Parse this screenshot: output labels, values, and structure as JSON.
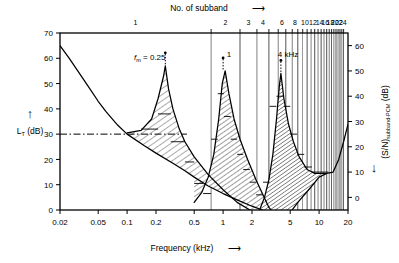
{
  "figure": {
    "top_axis_title": "No. of subband",
    "top_axis_arrow": "⟶",
    "x_axis_title": "Frequency (kHz)",
    "x_axis_arrow": "⟶",
    "y_left_title_main": "L",
    "y_left_title_sub": "T",
    "y_left_title_unit": " (dB)",
    "y_left_arrow": "↑",
    "y_right_title_main": "(S/N)",
    "y_right_title_sub": "subband-PCM",
    "y_right_title_unit": " (dB)",
    "y_right_arrow": "↓",
    "annotations": [
      {
        "id": "masker-1",
        "text_italic": "f",
        "text_sub": "m",
        "text_rest": " = 0.25",
        "freq_khz": 0.25,
        "level_db": 57
      },
      {
        "id": "masker-2",
        "text_plain": "1",
        "freq_khz": 1.0,
        "level_db": 55
      },
      {
        "id": "masker-3",
        "text_plain": "4 kHz",
        "freq_khz": 4.0,
        "level_db": 54
      }
    ]
  },
  "chart_data": {
    "type": "line",
    "title": "",
    "xlabel": "Frequency (kHz)",
    "ylabel": "L_T (dB)",
    "y2label": "(S/N)_subband-PCM (dB)",
    "xscale": "log",
    "xlim": [
      0.02,
      20
    ],
    "ylim": [
      0,
      70
    ],
    "y2lim": [
      65,
      -5
    ],
    "grid": false,
    "legend": null,
    "xticks": [
      0.02,
      0.05,
      0.1,
      0.2,
      0.5,
      1,
      2,
      5,
      10,
      20
    ],
    "xticklabels": [
      "0.02",
      "0.05",
      "0.1",
      "0.2",
      "0.5",
      "1",
      "2",
      "5",
      "10",
      "20"
    ],
    "yticks": [
      0,
      10,
      20,
      30,
      40,
      50,
      60,
      70
    ],
    "yticklabels": [
      "0",
      "10",
      "20",
      "30",
      "40",
      "50",
      "60",
      "70"
    ],
    "y2ticks": [
      0,
      10,
      20,
      30,
      40,
      50,
      60
    ],
    "y2ticklabels": [
      "0",
      "10",
      "20",
      "30",
      "40",
      "50",
      "60"
    ],
    "top_axis": {
      "label": "No. of subband",
      "labelled_subbands": [
        1,
        2,
        3,
        4,
        6,
        8,
        10,
        12,
        14,
        16,
        18,
        20,
        22,
        24
      ],
      "labelled_text": [
        "1",
        "2",
        "3",
        "4",
        "6",
        "8",
        "10",
        "12",
        "14",
        "16",
        "18",
        "20",
        "22",
        "24"
      ],
      "n_subbands": 24,
      "subband_edges_khz": [
        0.0,
        0.75,
        1.5,
        2.25,
        3.0,
        3.75,
        4.5,
        5.25,
        6.0,
        6.75,
        7.5,
        8.25,
        9.0,
        9.75,
        10.5,
        11.25,
        12.0,
        12.75,
        13.5,
        14.25,
        15.0,
        15.75,
        16.5,
        17.25,
        18.0
      ]
    },
    "series": [
      {
        "name": "threshold-in-quiet",
        "style": "solid",
        "points_khz_db": [
          [
            0.02,
            65
          ],
          [
            0.025,
            60
          ],
          [
            0.03,
            55.5
          ],
          [
            0.04,
            48.5
          ],
          [
            0.05,
            43
          ],
          [
            0.06,
            39
          ],
          [
            0.08,
            33.5
          ],
          [
            0.1,
            30
          ],
          [
            0.15,
            25.5
          ],
          [
            0.2,
            22.5
          ],
          [
            0.3,
            18.5
          ],
          [
            0.4,
            15.5
          ],
          [
            0.5,
            13
          ],
          [
            0.7,
            9.5
          ],
          [
            1.0,
            6.5
          ],
          [
            1.5,
            3.5
          ],
          [
            2.0,
            1.5
          ],
          [
            3.0,
            -1.0
          ],
          [
            3.5,
            -2.0
          ],
          [
            4.0,
            -3.0
          ],
          [
            5.0,
            -1.0
          ],
          [
            6.0,
            3.0
          ],
          [
            8.0,
            8.5
          ],
          [
            10.0,
            13.0
          ],
          [
            12.0,
            14.5
          ],
          [
            14.0,
            15.0
          ],
          [
            16.0,
            20.0
          ],
          [
            18.0,
            27.0
          ],
          [
            20.0,
            34.0
          ]
        ]
      },
      {
        "name": "masking-threshold-fm-0.25kHz",
        "style": "solid",
        "masker_freq_khz": 0.25,
        "masker_level_db": 57,
        "points_khz_db": [
          [
            0.1,
            30.5
          ],
          [
            0.14,
            31.5
          ],
          [
            0.18,
            36
          ],
          [
            0.21,
            44
          ],
          [
            0.24,
            53
          ],
          [
            0.25,
            57
          ],
          [
            0.27,
            48
          ],
          [
            0.3,
            40
          ],
          [
            0.35,
            32
          ],
          [
            0.4,
            27
          ],
          [
            0.5,
            21
          ],
          [
            0.7,
            14
          ],
          [
            1.0,
            8
          ],
          [
            1.4,
            3
          ],
          [
            2.0,
            -0.5
          ],
          [
            2.6,
            -2.0
          ],
          [
            3.2,
            -2.5
          ]
        ]
      },
      {
        "name": "masking-threshold-fm-1kHz",
        "style": "solid",
        "masker_freq_khz": 1.0,
        "masker_level_db": 55,
        "points_khz_db": [
          [
            0.5,
            3
          ],
          [
            0.6,
            7
          ],
          [
            0.7,
            13
          ],
          [
            0.8,
            22
          ],
          [
            0.9,
            36
          ],
          [
            0.98,
            50
          ],
          [
            1.05,
            55
          ],
          [
            1.15,
            46
          ],
          [
            1.3,
            36
          ],
          [
            1.5,
            28
          ],
          [
            1.8,
            20
          ],
          [
            2.2,
            12
          ],
          [
            2.6,
            6
          ],
          [
            3.0,
            1
          ],
          [
            3.5,
            -2
          ],
          [
            3.9,
            -4
          ]
        ]
      },
      {
        "name": "masking-threshold-fm-4kHz",
        "style": "solid",
        "masker_freq_khz": 4.0,
        "masker_level_db": 54,
        "points_khz_db": [
          [
            2.4,
            0
          ],
          [
            2.7,
            5
          ],
          [
            3.0,
            12
          ],
          [
            3.3,
            22
          ],
          [
            3.6,
            36
          ],
          [
            3.85,
            49
          ],
          [
            4.0,
            54
          ],
          [
            4.3,
            44
          ],
          [
            4.8,
            34
          ],
          [
            5.4,
            27
          ],
          [
            6.2,
            21
          ],
          [
            7.5,
            16
          ],
          [
            9.0,
            14.5
          ],
          [
            10.5,
            14.5
          ],
          [
            12.0,
            14.5
          ]
        ]
      },
      {
        "name": "threshold-in-quiet-reference-line",
        "style": "dash-dot",
        "constant_db": 30,
        "x_range_khz": [
          0.02,
          0.42
        ]
      }
    ],
    "subband_signal_to_mask_steps": [
      {
        "subband": 2,
        "x_range_khz": [
          0.14,
          0.21
        ],
        "top_db": 32
      },
      {
        "subband": 3,
        "x_range_khz": [
          0.21,
          0.285
        ],
        "top_db": 38
      },
      {
        "subband": 4,
        "x_range_khz": [
          0.285,
          0.4
        ],
        "top_db": 27
      },
      {
        "subband": 5,
        "x_range_khz": [
          0.4,
          0.5
        ],
        "top_db": 19
      },
      {
        "subband": 6,
        "x_range_khz": [
          0.5,
          0.62
        ],
        "top_db": 10.5
      },
      {
        "subband": 7,
        "x_range_khz": [
          0.62,
          0.75
        ],
        "top_db": 6.5
      },
      {
        "subband": 8,
        "x_range_khz": [
          0.75,
          0.88
        ],
        "top_db": 28
      },
      {
        "subband": 9,
        "x_range_khz": [
          0.88,
          1.02
        ],
        "top_db": 46
      },
      {
        "subband": 10,
        "x_range_khz": [
          1.02,
          1.2
        ],
        "top_db": 37
      },
      {
        "subband": 11,
        "x_range_khz": [
          1.2,
          1.4
        ],
        "top_db": 28
      },
      {
        "subband": 12,
        "x_range_khz": [
          1.4,
          1.62
        ],
        "top_db": 22
      },
      {
        "subband": 13,
        "x_range_khz": [
          1.62,
          1.9
        ],
        "top_db": 16
      },
      {
        "subband": 14,
        "x_range_khz": [
          1.9,
          2.2
        ],
        "top_db": 11
      },
      {
        "subband": 15,
        "x_range_khz": [
          2.2,
          2.6
        ],
        "top_db": 6
      },
      {
        "subband": 16,
        "x_range_khz": [
          2.6,
          3.05
        ],
        "top_db": 11
      },
      {
        "subband": 17,
        "x_range_khz": [
          3.05,
          3.6
        ],
        "top_db": 41
      },
      {
        "subband": 18,
        "x_range_khz": [
          3.6,
          4.3
        ],
        "top_db": 45
      },
      {
        "subband": 19,
        "x_range_khz": [
          4.3,
          5.0
        ],
        "top_db": 41
      },
      {
        "subband": 20,
        "x_range_khz": [
          5.0,
          5.9
        ],
        "top_db": 30
      },
      {
        "subband": 21,
        "x_range_khz": [
          5.9,
          7.0
        ],
        "top_db": 22
      },
      {
        "subband": 22,
        "x_range_khz": [
          7.0,
          8.4
        ],
        "top_db": 17
      },
      {
        "subband": 23,
        "x_range_khz": [
          8.4,
          10.2
        ],
        "top_db": 15
      },
      {
        "subband": 24,
        "x_range_khz": [
          10.2,
          12.5
        ],
        "top_db": 15
      }
    ]
  }
}
